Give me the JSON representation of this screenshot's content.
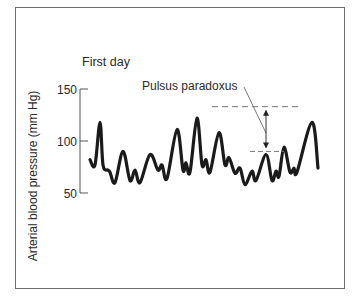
{
  "chart_data": {
    "type": "line",
    "title": "First day",
    "xlabel": "",
    "ylabel": "Arterial blood pressure (mm Hg)",
    "ylim": [
      50,
      150
    ],
    "yticks": [
      50,
      100,
      150
    ],
    "ytick_labels": [
      "50",
      "100",
      "150"
    ],
    "grid": false,
    "legend": null,
    "series": [
      {
        "name": "Arterial pressure waveform",
        "x": [
          0,
          5,
          10,
          13,
          18,
          20,
          25,
          33,
          40,
          45,
          50,
          60,
          68,
          72,
          77,
          87,
          93,
          96,
          100,
          107,
          112,
          116,
          120,
          129,
          135,
          139,
          145,
          150,
          155,
          162,
          166,
          176,
          182,
          186,
          189,
          194,
          200,
          204,
          207,
          222,
          228
        ],
        "values": [
          82,
          77,
          118,
          77,
          72,
          70,
          60,
          90,
          62,
          72,
          60,
          87,
          72,
          77,
          64,
          111,
          72,
          79,
          70,
          122,
          77,
          82,
          70,
          108,
          77,
          84,
          69,
          74,
          58,
          71,
          62,
          87,
          62,
          71,
          66,
          94,
          70,
          74,
          70,
          118,
          74
        ]
      }
    ],
    "annotations": [
      {
        "text": "Pulsus paradoxus",
        "type": "range-arrow",
        "upper_value": 133,
        "lower_value": 90
      }
    ]
  }
}
